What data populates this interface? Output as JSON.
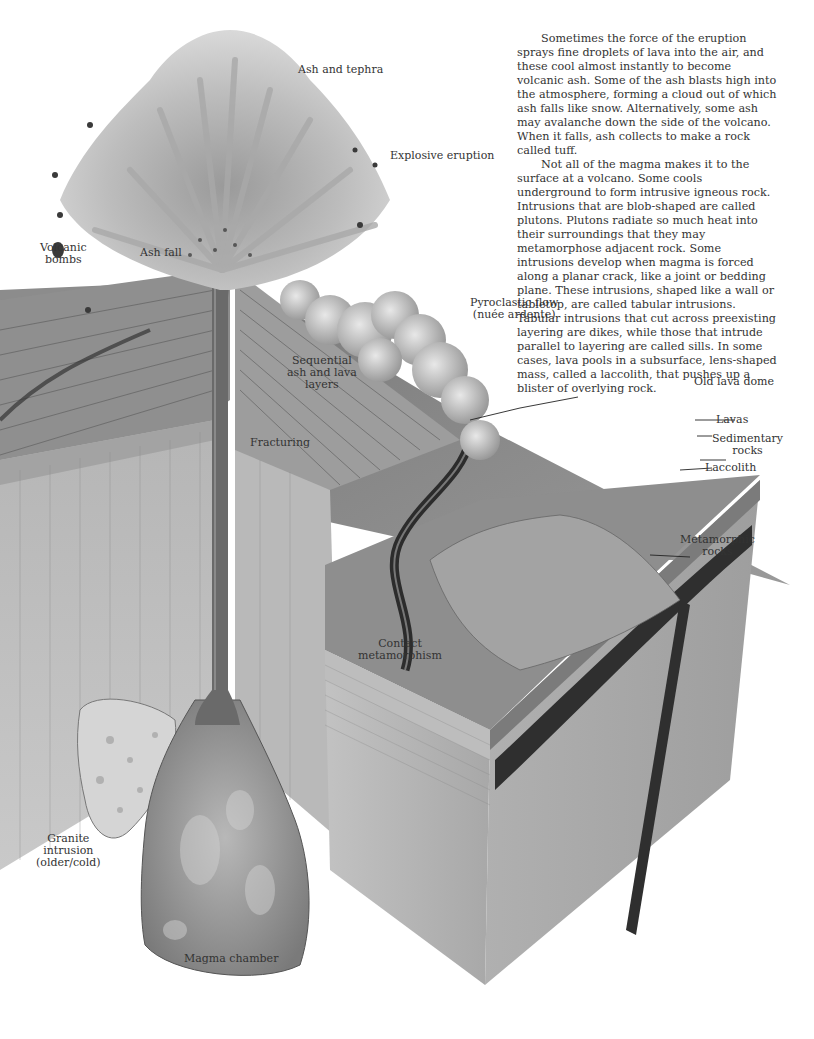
{
  "figure": {
    "labels": {
      "ash_and_tephra": "Ash and tephra",
      "explosive_eruption": "Explosive eruption",
      "volcanic_bombs": [
        "Volcanic",
        "bombs"
      ],
      "ash_fall": "Ash fall",
      "pyroclastic_flow": [
        "Pyroclastic flow",
        "(nuée ardente)"
      ],
      "sequential_layers": [
        "Sequential",
        "ash and lava",
        "layers"
      ],
      "fracturing": "Fracturing",
      "old_lava_dome": "Old lava dome",
      "lavas": "Lavas",
      "sedimentary_rocks": [
        "Sedimentary",
        "rocks"
      ],
      "laccolith": "Laccolith",
      "metamorphic_rocks": [
        "Metamorphic",
        "rocks"
      ],
      "contact_metamorphism": [
        "Contact",
        "metamorphism"
      ],
      "granite_intrusion": [
        "Granite",
        "intrusion",
        "(older/cold)"
      ],
      "magma_chamber": "Magma chamber"
    }
  },
  "body_text": {
    "paragraphs": [
      "Sometimes the force of the eruption sprays fine droplets of lava into the air, and these cool almost instantly to become volcanic ash. Some of the ash blasts high into the atmosphere, forming a cloud out of which ash falls like snow. Alternatively, some ash may avalanche down the side of the volcano. When it falls, ash collects to make a rock called tuff.",
      "Not all of the magma makes it to the surface at a volcano. Some cools underground to form intrusive igneous rock. Intrusions that are blob-shaped are called plutons. Plutons radiate so much heat into their surroundings that they may metamorphose adjacent rock. Some intrusions develop when magma is forced along a planar crack, like a joint or bedding plane. These intrusions, shaped like a wall or tabletop, are called tabular intrusions. Tabular intrusions that cut across preexisting layering are dikes, while those that intrude parallel to layering are called sills. In some cases, lava pools in a subsurface, lens-shaped mass, called a laccolith, that pushes up a blister of overlying rock."
    ]
  }
}
